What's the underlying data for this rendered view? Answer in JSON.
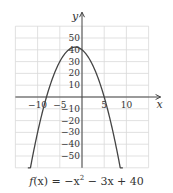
{
  "chart_data": {
    "type": "line",
    "title": "",
    "caption": "f(x) = −x² − 3x + 40",
    "function": "f(x) = -x^2 - 3x + 40",
    "xlabel": "x",
    "ylabel": "y",
    "xlim": [
      -15,
      15
    ],
    "ylim": [
      -60,
      60
    ],
    "grid": true,
    "x_ticks": [
      -10,
      -5,
      5,
      10
    ],
    "y_ticks": [
      50,
      40,
      30,
      20,
      10,
      -10,
      -20,
      -30,
      -40,
      -50
    ],
    "x_tick_labels": [
      "−10",
      "−5",
      "5",
      "10"
    ],
    "y_tick_labels": [
      "50",
      "40",
      "30",
      "20",
      "10",
      "−10",
      "−20",
      "−30",
      "−40",
      "−50"
    ],
    "series": [
      {
        "name": "f(x)",
        "x": [
          -12.2,
          -10,
          -8,
          -6,
          -4,
          -3,
          -1.5,
          0,
          1,
          2,
          3,
          4,
          5,
          6,
          7,
          8,
          9.2
        ],
        "y": [
          -72.2,
          -30,
          0,
          22,
          36,
          40,
          42.25,
          40,
          36,
          30,
          22,
          12,
          0,
          -14,
          -30,
          -48,
          -72.2
        ]
      }
    ],
    "key_points": {
      "vertex": [
        -1.5,
        42.25
      ],
      "roots": [
        -8,
        5
      ],
      "y_intercept": 40
    },
    "colors": {
      "curve": "#444444",
      "grid": "#d9d9d9",
      "axis": "#444444"
    }
  },
  "caption": {
    "prefix": "f",
    "arg": "(x)",
    "rest": " = −x",
    "exp": "2",
    "tail": " − 3x + 40"
  }
}
